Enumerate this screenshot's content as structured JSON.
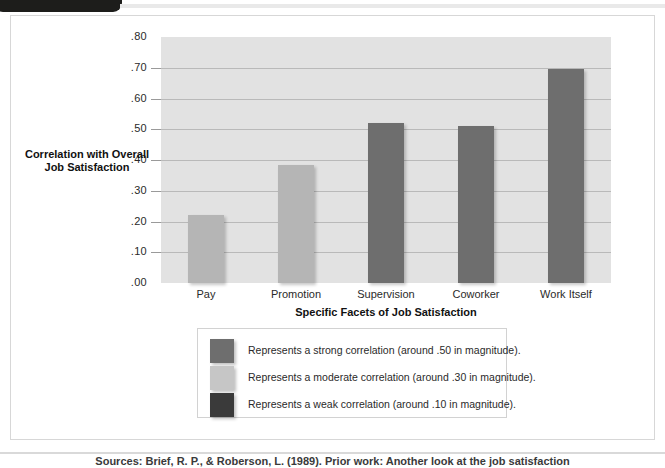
{
  "page": {
    "top_tab_label": "",
    "bottom_caption": "Sources: Brief, R. P., & Roberson, L. (1989). Prior work: Another look at the job satisfaction"
  },
  "chart_data": {
    "type": "bar",
    "title": "",
    "categories": [
      "Pay",
      "Promotion",
      "Supervision",
      "Coworker",
      "Work Itself"
    ],
    "values": [
      0.22,
      0.385,
      0.52,
      0.51,
      0.695
    ],
    "bar_colors": [
      "#b5b5b5",
      "#b5b5b5",
      "#6e6e6e",
      "#6e6e6e",
      "#6e6e6e"
    ],
    "xlabel": "Specific Facets of Job Satisfaction",
    "ylabel": "Correlation with Overall Job Satisfaction",
    "ylim": [
      0.0,
      0.8
    ],
    "ytick_labels": [
      ".80",
      ".70",
      ".60",
      ".50",
      ".40",
      ".30",
      ".20",
      ".10",
      ".00"
    ],
    "ytick_values": [
      0.8,
      0.7,
      0.6,
      0.5,
      0.4,
      0.3,
      0.2,
      0.1,
      0.0
    ],
    "grid": true,
    "plot_background": "#e2e2e2",
    "legend_position": "below-plot",
    "legend": [
      {
        "color": "#6e6e6e",
        "label": "Represents a strong correlation (around .50 in magnitude)."
      },
      {
        "color": "#c6c6c6",
        "label": "Represents a moderate correlation (around .30 in magnitude)."
      },
      {
        "color": "#3a3a3a",
        "label": "Represents a weak correlation (around .10 in magnitude)."
      }
    ]
  }
}
